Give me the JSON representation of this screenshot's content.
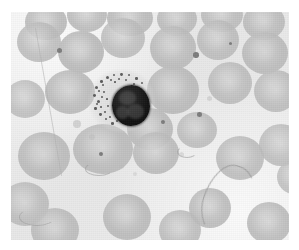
{
  "image": {
    "kind": "light-microscopy-photomicrograph",
    "subject": "peripheral blood smear",
    "title": "Peripheral blood smear photomicrograph",
    "stain": "Romanowsky / Wright-Giemsa (grayscale reproduction)",
    "border_color": "#ffffff",
    "background_color": "#ececec",
    "rbc_color": "#bdbdbd",
    "nucleus_color": "#141414",
    "cytoplasm_color": "#d6d6d6",
    "granule_color": "#5e5e5e",
    "filament_color": "#969696",
    "frame": {
      "left": 11,
      "top": 12,
      "width": 278,
      "height": 228
    }
  },
  "features": {
    "white_blood_cell": {
      "label": "nucleated white blood cell",
      "cell_x": 78,
      "cell_y": 58,
      "cell_w": 66,
      "cell_h": 62,
      "nucleus_x": 23,
      "nucleus_y": 15,
      "nucleus_w": 38,
      "nucleus_h": 41,
      "granules": [
        {
          "x": 6,
          "y": 16,
          "d": 3.2
        },
        {
          "x": 11,
          "y": 10,
          "d": 2.6
        },
        {
          "x": 17,
          "y": 6,
          "d": 3.0
        },
        {
          "x": 24,
          "y": 4,
          "d": 2.4
        },
        {
          "x": 31,
          "y": 3,
          "d": 2.8
        },
        {
          "x": 39,
          "y": 4,
          "d": 2.3
        },
        {
          "x": 46,
          "y": 7,
          "d": 2.7
        },
        {
          "x": 52,
          "y": 12,
          "d": 2.4
        },
        {
          "x": 4,
          "y": 24,
          "d": 2.9
        },
        {
          "x": 8,
          "y": 30,
          "d": 3.1
        },
        {
          "x": 5,
          "y": 37,
          "d": 2.5
        },
        {
          "x": 10,
          "y": 43,
          "d": 2.8
        },
        {
          "x": 16,
          "y": 48,
          "d": 2.4
        },
        {
          "x": 22,
          "y": 52,
          "d": 2.6
        },
        {
          "x": 14,
          "y": 21,
          "d": 2.2
        },
        {
          "x": 18,
          "y": 35,
          "d": 2.0
        },
        {
          "x": 13,
          "y": 14,
          "d": 2.1
        },
        {
          "x": 21,
          "y": 9,
          "d": 2.0
        },
        {
          "x": 29,
          "y": 8,
          "d": 1.9
        },
        {
          "x": 36,
          "y": 9,
          "d": 2.1
        },
        {
          "x": 44,
          "y": 13,
          "d": 2.2
        },
        {
          "x": 49,
          "y": 19,
          "d": 2.0
        },
        {
          "x": 9,
          "y": 20,
          "d": 1.8
        },
        {
          "x": 12,
          "y": 26,
          "d": 1.9
        },
        {
          "x": 7,
          "y": 33,
          "d": 2.0
        },
        {
          "x": 15,
          "y": 41,
          "d": 1.8
        },
        {
          "x": 20,
          "y": 46,
          "d": 1.9
        },
        {
          "x": 27,
          "y": 50,
          "d": 1.8
        },
        {
          "x": 33,
          "y": 52,
          "d": 2.0
        },
        {
          "x": 39,
          "y": 50,
          "d": 1.9
        },
        {
          "x": 46,
          "y": 45,
          "d": 2.2
        },
        {
          "x": 51,
          "y": 38,
          "d": 2.0
        },
        {
          "x": 53,
          "y": 28,
          "d": 1.9
        },
        {
          "x": 25,
          "y": 11,
          "d": 1.7
        },
        {
          "x": 17,
          "y": 28,
          "d": 1.7
        },
        {
          "x": 11,
          "y": 36,
          "d": 1.6
        }
      ]
    },
    "red_blood_cells": [
      {
        "x": 14,
        "y": -8,
        "w": 42,
        "h": 36,
        "o": 0.92
      },
      {
        "x": 56,
        "y": -14,
        "w": 40,
        "h": 34,
        "o": 0.9
      },
      {
        "x": 96,
        "y": -12,
        "w": 46,
        "h": 36,
        "o": 0.93
      },
      {
        "x": 146,
        "y": -10,
        "w": 40,
        "h": 34,
        "o": 0.9
      },
      {
        "x": 190,
        "y": -14,
        "w": 42,
        "h": 34,
        "o": 0.88
      },
      {
        "x": 232,
        "y": -8,
        "w": 42,
        "h": 36,
        "o": 0.9
      },
      {
        "x": 6,
        "y": 10,
        "w": 44,
        "h": 40,
        "o": 0.88
      },
      {
        "x": 47,
        "y": 19,
        "w": 46,
        "h": 42,
        "o": 0.95
      },
      {
        "x": 90,
        "y": 6,
        "w": 44,
        "h": 40,
        "o": 0.86
      },
      {
        "x": 139,
        "y": 14,
        "w": 46,
        "h": 44,
        "o": 0.92
      },
      {
        "x": 186,
        "y": 8,
        "w": 42,
        "h": 40,
        "o": 0.88
      },
      {
        "x": 231,
        "y": 20,
        "w": 46,
        "h": 42,
        "o": 0.92
      },
      {
        "x": 34,
        "y": 58,
        "w": 50,
        "h": 44,
        "o": 0.93
      },
      {
        "x": 136,
        "y": 54,
        "w": 52,
        "h": 48,
        "o": 0.95
      },
      {
        "x": 197,
        "y": 50,
        "w": 44,
        "h": 42,
        "o": 0.88
      },
      {
        "x": 243,
        "y": 58,
        "w": 44,
        "h": 42,
        "o": 0.88
      },
      {
        "x": -6,
        "y": 68,
        "w": 40,
        "h": 38,
        "o": 0.84
      },
      {
        "x": 116,
        "y": 96,
        "w": 46,
        "h": 42,
        "o": 0.92
      },
      {
        "x": 166,
        "y": 100,
        "w": 40,
        "h": 36,
        "o": 0.86
      },
      {
        "x": 7,
        "y": 120,
        "w": 52,
        "h": 48,
        "o": 0.93
      },
      {
        "x": 62,
        "y": 112,
        "w": 60,
        "h": 50,
        "o": 0.93
      },
      {
        "x": 122,
        "y": 120,
        "w": 46,
        "h": 42,
        "o": 0.9
      },
      {
        "x": 205,
        "y": 124,
        "w": 48,
        "h": 44,
        "o": 0.88
      },
      {
        "x": 248,
        "y": 112,
        "w": 44,
        "h": 42,
        "o": 0.86
      },
      {
        "x": -10,
        "y": 170,
        "w": 48,
        "h": 44,
        "o": 0.88
      },
      {
        "x": 20,
        "y": 196,
        "w": 48,
        "h": 44,
        "o": 0.9
      },
      {
        "x": 92,
        "y": 182,
        "w": 48,
        "h": 46,
        "o": 0.92
      },
      {
        "x": 148,
        "y": 198,
        "w": 42,
        "h": 40,
        "o": 0.88
      },
      {
        "x": 178,
        "y": 176,
        "w": 42,
        "h": 40,
        "o": 0.9
      },
      {
        "x": 236,
        "y": 190,
        "w": 44,
        "h": 42,
        "o": 0.9
      },
      {
        "x": 266,
        "y": 148,
        "w": 34,
        "h": 34,
        "o": 0.82
      }
    ],
    "platelets": [
      {
        "x": 62,
        "y": 108,
        "d": 8,
        "o": 0.55
      },
      {
        "x": 78,
        "y": 122,
        "d": 6,
        "o": 0.45
      },
      {
        "x": 108,
        "y": 152,
        "d": 5,
        "o": 0.4
      },
      {
        "x": 122,
        "y": 160,
        "d": 4,
        "o": 0.35
      },
      {
        "x": 196,
        "y": 84,
        "d": 5,
        "o": 0.45
      },
      {
        "x": 168,
        "y": 140,
        "d": 5,
        "o": 0.4
      }
    ],
    "dark_specks": [
      {
        "x": 46,
        "y": 36,
        "d": 5.0
      },
      {
        "x": 182,
        "y": 40,
        "d": 5.5
      },
      {
        "x": 186,
        "y": 100,
        "d": 4.6
      },
      {
        "x": 150,
        "y": 108,
        "d": 4.0
      },
      {
        "x": 88,
        "y": 140,
        "d": 4.2
      },
      {
        "x": 218,
        "y": 30,
        "d": 3.0
      }
    ],
    "artifacts": {
      "diagonal_streak": {
        "x": 24,
        "y": 16,
        "len": 150,
        "angle": 80
      },
      "hook_filament": {
        "x": 192,
        "y": 152,
        "w": 46,
        "h": 74
      },
      "thin_links": [
        {
          "x": 8,
          "y": 196,
          "w": 34,
          "h": 16
        },
        {
          "x": 74,
          "y": 150,
          "w": 26,
          "h": 12
        },
        {
          "x": 166,
          "y": 134,
          "w": 18,
          "h": 10
        }
      ]
    }
  }
}
